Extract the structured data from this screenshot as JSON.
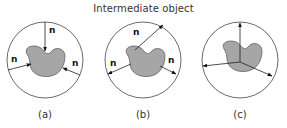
{
  "title": "Intermediate object",
  "colors": {
    "object_fill": "#a6a6a6",
    "object_stroke": "#555555",
    "line": "#222222",
    "circle": "#444444"
  },
  "panels": [
    {
      "id": "a",
      "caption": "(a)",
      "vector_label": "n",
      "arrow_direction": "inward"
    },
    {
      "id": "b",
      "caption": "(b)",
      "vector_label": "n",
      "arrow_direction": "outward"
    },
    {
      "id": "c",
      "caption": "(c)",
      "vector_label": "",
      "arrow_direction": "outward-from-center"
    }
  ]
}
